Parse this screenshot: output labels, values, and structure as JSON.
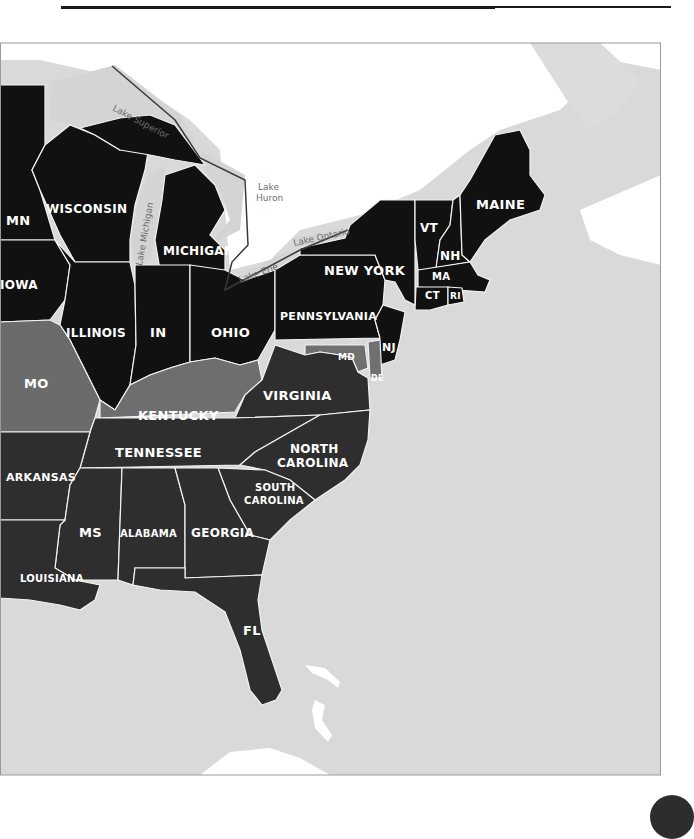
{
  "header": {
    "text_fragment": "..."
  },
  "map": {
    "colors": {
      "ocean": "#d9d9d9",
      "land_unshaded": "#ffffff",
      "state_black": "#111111",
      "state_dark": "#2e2e2e",
      "state_medium": "#555555",
      "state_light": "#707070",
      "border": "#f2f2f2",
      "lake_outline": "#3a3a3a",
      "lake_label": "#6e6e6e"
    },
    "states": [
      {
        "id": "mn",
        "label": "MN"
      },
      {
        "id": "wisconsin",
        "label": "WISCONSIN"
      },
      {
        "id": "michigan",
        "label": "MICHIGAN"
      },
      {
        "id": "iowa",
        "label": "IOWA"
      },
      {
        "id": "illinois",
        "label": "ILLINOIS"
      },
      {
        "id": "indiana",
        "label": "IN"
      },
      {
        "id": "ohio",
        "label": "OHIO"
      },
      {
        "id": "pennsylvania",
        "label": "PENNSYLVANIA"
      },
      {
        "id": "new-york",
        "label": "NEW YORK"
      },
      {
        "id": "vermont",
        "label": "VT"
      },
      {
        "id": "new-hampshire",
        "label": "NH"
      },
      {
        "id": "maine",
        "label": "MAINE"
      },
      {
        "id": "massachusetts",
        "label": "MA"
      },
      {
        "id": "connecticut",
        "label": "CT"
      },
      {
        "id": "rhode-island",
        "label": "RI"
      },
      {
        "id": "new-jersey",
        "label": "NJ"
      },
      {
        "id": "maryland",
        "label": "MD"
      },
      {
        "id": "delaware",
        "label": "DE"
      },
      {
        "id": "missouri",
        "label": "MO"
      },
      {
        "id": "kentucky",
        "label": "KENTUCKY"
      },
      {
        "id": "virginia",
        "label": "VIRGINIA"
      },
      {
        "id": "tennessee",
        "label": "TENNESSEE"
      },
      {
        "id": "north-carolina",
        "label_line1": "NORTH",
        "label_line2": "CAROLINA"
      },
      {
        "id": "south-carolina",
        "label_line1": "SOUTH",
        "label_line2": "CAROLINA"
      },
      {
        "id": "arkansas",
        "label": "ARKANSAS"
      },
      {
        "id": "mississippi",
        "label": "MS"
      },
      {
        "id": "alabama",
        "label": "ALABAMA"
      },
      {
        "id": "georgia",
        "label": "GEORGIA"
      },
      {
        "id": "louisiana",
        "label": "LOUISIANA"
      },
      {
        "id": "florida",
        "label": "FL"
      }
    ],
    "lakes": [
      {
        "id": "lake-superior",
        "label": "Lake Superior"
      },
      {
        "id": "lake-michigan",
        "label": "Lake Michigan"
      },
      {
        "id": "lake-huron",
        "label_line1": "Lake",
        "label_line2": "Huron"
      },
      {
        "id": "lake-erie",
        "label": "Lake Erie"
      },
      {
        "id": "lake-ontario",
        "label": "Lake Ontario"
      }
    ]
  }
}
